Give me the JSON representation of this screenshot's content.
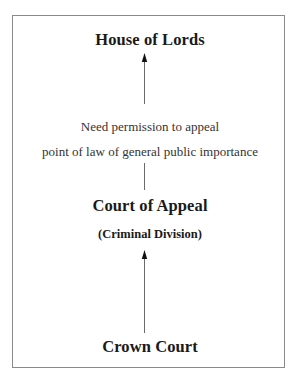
{
  "diagram": {
    "type": "hierarchy-flow",
    "direction": "bottom-to-top",
    "nodes": [
      {
        "id": "house_of_lords",
        "label": "House of Lords"
      },
      {
        "id": "court_of_appeal",
        "label": "Court of Appeal",
        "sublabel": "(Criminal Division)"
      },
      {
        "id": "crown_court",
        "label": "Crown Court"
      }
    ],
    "edges": [
      {
        "from": "crown_court",
        "to": "court_of_appeal",
        "style": "arrow"
      },
      {
        "from": "court_of_appeal",
        "to": "house_of_lords",
        "style": "arrow",
        "annotation": [
          "Need permission to appeal",
          "point of law of general public importance"
        ]
      }
    ]
  },
  "labels": {
    "top": "House of Lords",
    "note_line1": "Need permission to appeal",
    "note_line2": "point of law of general public importance",
    "middle": "Court of Appeal",
    "middle_sub": "(Criminal Division)",
    "bottom": "Crown Court"
  },
  "colors": {
    "text": "#1a1a1a",
    "frame": "#8a8a8a",
    "connector": "#555555"
  }
}
